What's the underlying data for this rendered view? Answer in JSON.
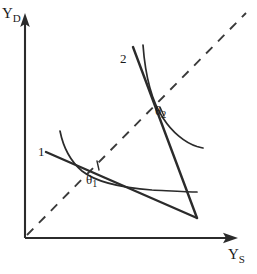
{
  "figure": {
    "title": "",
    "background_color": "#ffffff",
    "stroke_color": "#2b2b2b"
  },
  "axes": {
    "y_axis": {
      "label_base": "Y",
      "label_sub": "D",
      "name": "vertical-axis",
      "arrow": true
    },
    "x_axis": {
      "label_base": "Y",
      "label_sub": "S",
      "name": "horizontal-axis",
      "arrow": true
    },
    "origin": {
      "x": 25,
      "y": 238
    }
  },
  "reference_line": {
    "name": "forty-five-degree-dashed-line",
    "style": "dashed",
    "from": {
      "x": 27,
      "y": 235
    },
    "to": {
      "x": 246,
      "y": 13
    }
  },
  "curves": [
    {
      "id": "indifference-curve-1",
      "label": "1",
      "type": "indifference-curve",
      "style": "solid",
      "points": [
        [
          60,
          132
        ],
        [
          66,
          149
        ],
        [
          76,
          165
        ],
        [
          92,
          177
        ],
        [
          120,
          186
        ],
        [
          155,
          190
        ],
        [
          197,
          192
        ]
      ]
    },
    {
      "id": "budget-line-1",
      "label": "1",
      "type": "budget-line",
      "style": "solid-straight",
      "from": {
        "x": 46,
        "y": 152
      },
      "to": {
        "x": 197,
        "y": 218
      }
    },
    {
      "id": "indifference-curve-2",
      "label": "2",
      "type": "indifference-curve",
      "style": "solid",
      "points": [
        [
          143,
          45
        ],
        [
          147,
          70
        ],
        [
          154,
          95
        ],
        [
          163,
          117
        ],
        [
          175,
          134
        ],
        [
          189,
          144
        ],
        [
          203,
          148
        ]
      ]
    },
    {
      "id": "budget-line-2",
      "label": "2",
      "type": "budget-line",
      "style": "solid-straight",
      "from": {
        "x": 133,
        "y": 47
      },
      "to": {
        "x": 197,
        "y": 218
      }
    }
  ],
  "angles": [
    {
      "id": "theta-1",
      "symbol": "θ",
      "subscript": "1",
      "at": {
        "x": 96,
        "y": 165
      }
    },
    {
      "id": "theta-2",
      "symbol": "θ",
      "subscript": "2",
      "at": {
        "x": 164,
        "y": 118
      }
    }
  ],
  "labels": {
    "curve_one": "1",
    "curve_two": "2",
    "theta_one_symbol": "θ",
    "theta_one_sub": "1",
    "theta_two_symbol": "θ",
    "theta_two_sub": "2",
    "y_d_base": "Y",
    "y_d_sub": "D",
    "y_s_base": "Y",
    "y_s_sub": "S"
  }
}
